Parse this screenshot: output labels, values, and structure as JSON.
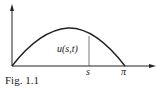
{
  "figure": {
    "caption": "Fig. 1.1",
    "curve_label": "u(s,t)",
    "x_tick_s": "s",
    "x_tick_pi": "π"
  },
  "colors": {
    "ink": "#222222",
    "background": "#ffffff"
  }
}
